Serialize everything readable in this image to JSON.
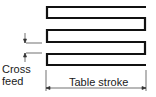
{
  "diagram": {
    "labels": {
      "cross_feed_line1": "Cross",
      "cross_feed_line2": "feed",
      "table_stroke": "Table stroke"
    },
    "colors": {
      "path": "#111111",
      "dimension": "#333333",
      "background": "#ffffff"
    },
    "path_passes": 6
  }
}
